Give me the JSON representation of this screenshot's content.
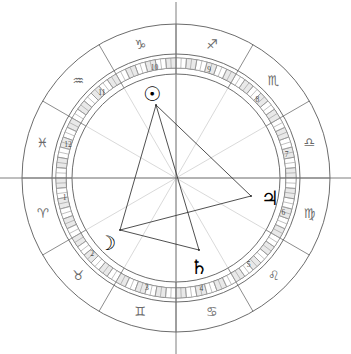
{
  "chart": {
    "type": "astrological-wheel",
    "center": {
      "x": 176,
      "y": 178
    },
    "radii": {
      "outer_circle": 154,
      "sign_band_inner": 124,
      "degree_ring_outer": 120,
      "degree_ring_inner": 110,
      "house_circle": 104,
      "inner_area": 100
    },
    "background_color": "#ffffff",
    "line_color": "#5b5b5b",
    "glyph_color": "#6a6a6a",
    "planet_color": "#000000",
    "tick_fill_color": "#e9e9e9"
  },
  "zodiac_signs": [
    {
      "name": "Aries",
      "glyph": "♈",
      "angle_deg": 195,
      "radius": 138
    },
    {
      "name": "Taurus",
      "glyph": "♉",
      "angle_deg": 225,
      "radius": 138
    },
    {
      "name": "Gemini",
      "glyph": "♊",
      "angle_deg": 255,
      "radius": 138
    },
    {
      "name": "Cancer",
      "glyph": "♋",
      "angle_deg": 285,
      "radius": 138
    },
    {
      "name": "Leo",
      "glyph": "♌",
      "angle_deg": 315,
      "radius": 138
    },
    {
      "name": "Virgo",
      "glyph": "♍",
      "angle_deg": 345,
      "radius": 138
    },
    {
      "name": "Libra",
      "glyph": "♎",
      "angle_deg": 15,
      "radius": 138
    },
    {
      "name": "Scorpio",
      "glyph": "♏",
      "angle_deg": 45,
      "radius": 138
    },
    {
      "name": "Sagittarius",
      "glyph": "♐",
      "angle_deg": 75,
      "radius": 138
    },
    {
      "name": "Capricorn",
      "glyph": "♑",
      "angle_deg": 105,
      "radius": 138
    },
    {
      "name": "Aquarius",
      "glyph": "♒",
      "angle_deg": 135,
      "radius": 138
    },
    {
      "name": "Pisces",
      "glyph": "♓",
      "angle_deg": 165,
      "radius": 138
    }
  ],
  "houses": [
    {
      "number": "1",
      "angle_deg": 190,
      "radius": 113
    },
    {
      "number": "2",
      "angle_deg": 222,
      "radius": 113
    },
    {
      "number": "3",
      "angle_deg": 255,
      "radius": 113
    },
    {
      "number": "4",
      "angle_deg": 283,
      "radius": 113
    },
    {
      "number": "5",
      "angle_deg": 310,
      "radius": 113
    },
    {
      "number": "6",
      "angle_deg": 342,
      "radius": 113
    },
    {
      "number": "7",
      "angle_deg": 12,
      "radius": 113
    },
    {
      "number": "8",
      "angle_deg": 44,
      "radius": 113
    },
    {
      "number": "9",
      "angle_deg": 73,
      "radius": 113
    },
    {
      "number": "10",
      "angle_deg": 101,
      "radius": 113
    },
    {
      "number": "11",
      "angle_deg": 131,
      "radius": 113
    },
    {
      "number": "12",
      "angle_deg": 163,
      "radius": 113
    }
  ],
  "planets": [
    {
      "name": "Sun",
      "glyph": "☉",
      "label_x": 152,
      "label_y": 94,
      "point_x": 156,
      "point_y": 105
    },
    {
      "name": "Moon",
      "glyph": "☽",
      "label_x": 107,
      "label_y": 243,
      "point_x": 120,
      "point_y": 230
    },
    {
      "name": "Saturn",
      "glyph": "♄",
      "label_x": 199,
      "label_y": 267,
      "point_x": 199,
      "point_y": 250
    },
    {
      "name": "Jupiter",
      "glyph": "♃",
      "label_x": 270,
      "label_y": 198,
      "point_x": 251,
      "point_y": 196
    }
  ],
  "aspects": [
    {
      "from": "Sun",
      "to": "Moon"
    },
    {
      "from": "Sun",
      "to": "Saturn"
    },
    {
      "from": "Sun",
      "to": "Jupiter"
    },
    {
      "from": "Moon",
      "to": "Saturn"
    },
    {
      "from": "Moon",
      "to": "Jupiter"
    }
  ],
  "chart_data": {
    "type": "scatter",
    "xlabel": "",
    "ylabel": "",
    "categories": [
      "Aries",
      "Taurus",
      "Gemini",
      "Cancer",
      "Leo",
      "Virgo",
      "Libra",
      "Scorpio",
      "Sagittarius",
      "Capricorn",
      "Aquarius",
      "Pisces"
    ],
    "house_numbers": [
      1,
      2,
      3,
      4,
      5,
      6,
      7,
      8,
      9,
      10,
      11,
      12
    ],
    "series": [
      {
        "name": "Planet positions (degrees counter-clockwise from east/ascendant axis)",
        "points": [
          {
            "body": "Sun",
            "glyph": "☉",
            "angle_deg": 104,
            "sign": "Capricorn",
            "house": 10
          },
          {
            "body": "Moon",
            "glyph": "☽",
            "angle_deg": 222,
            "sign": "Taurus",
            "house": 2
          },
          {
            "body": "Saturn",
            "glyph": "♄",
            "angle_deg": 285,
            "sign": "Cancer",
            "house": 4
          },
          {
            "body": "Jupiter",
            "glyph": "♃",
            "angle_deg": 345,
            "sign": "Virgo",
            "house": 6
          }
        ]
      }
    ],
    "aspect_lines": [
      [
        "Sun",
        "Moon"
      ],
      [
        "Sun",
        "Saturn"
      ],
      [
        "Sun",
        "Jupiter"
      ],
      [
        "Moon",
        "Saturn"
      ],
      [
        "Moon",
        "Jupiter"
      ]
    ],
    "degree_ring_divisions": 72,
    "grid": false,
    "legend": "none"
  }
}
